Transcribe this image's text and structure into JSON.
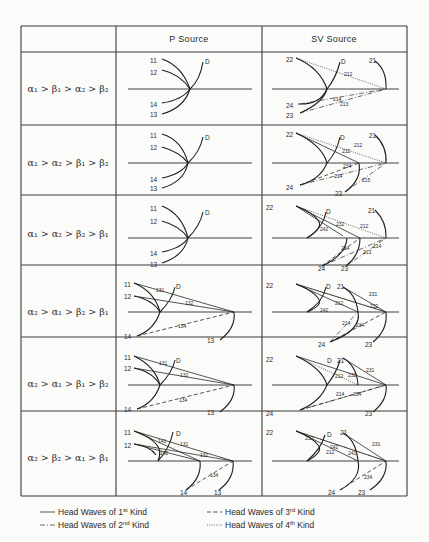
{
  "table": {
    "columns": [
      "",
      "P  Source",
      "SV  Source"
    ],
    "rows": [
      {
        "condition": "α₁ > β₁ > α₂ > β₂"
      },
      {
        "condition": "α₁ > α₂ > β₁ > β₂"
      },
      {
        "condition": "α₁ > α₂ > β₂ > β₁"
      },
      {
        "condition": "α₂ > α₁ > β₂ > β₁"
      },
      {
        "condition": "α₂ > α₁ > β₁ > β₂"
      },
      {
        "condition": "α₂ > β₂ > α₁ > β₁"
      }
    ]
  },
  "geometry": {
    "x": [
      21,
      116,
      262,
      407
    ],
    "y": [
      26,
      52,
      125,
      195,
      265,
      337,
      411,
      496
    ]
  },
  "diagrams": [
    {
      "row": 0,
      "p": {
        "iface": [
          [
            128,
            89
          ],
          [
            252,
            89
          ]
        ],
        "curves": [
          "M162,59 Q182,66 190,89",
          "M162,70 Q180,74 190,89",
          "M162,103 Q182,100 190,89",
          "M162,114 Q184,108 190,89",
          "M190,89 Q200,80 203,62"
        ],
        "lines": [],
        "labels": [
          [
            "11",
            150,
            61
          ],
          [
            "12",
            150,
            73
          ],
          [
            "14",
            150,
            105
          ],
          [
            "13",
            150,
            115
          ],
          [
            "D",
            205,
            62
          ]
        ]
      },
      "sv": {
        "iface": [
          [
            272,
            89
          ],
          [
            399,
            89
          ]
        ],
        "curves": [
          "M296,58 Q320,68 327,89 Q320,105 298,104",
          "M300,113 Q323,103 327,89 Q336,78 340,62",
          "M375,61 Q387,70 386,89"
        ],
        "lines": [
          [
            "k4",
            296,
            58,
            386,
            89
          ],
          [
            "k2",
            300,
            104,
            386,
            89
          ],
          [
            "k2",
            300,
            113,
            386,
            89
          ]
        ],
        "labels": [
          [
            "22",
            286,
            60
          ],
          [
            "D",
            341,
            62
          ],
          [
            "21",
            369,
            61
          ],
          [
            "24",
            286,
            106
          ],
          [
            "23",
            286,
            116
          ]
        ],
        "small": [
          [
            "212",
            344,
            76
          ],
          [
            "214",
            333,
            101
          ],
          [
            "213",
            340,
            106
          ]
        ]
      }
    },
    {
      "row": 1,
      "p": {
        "iface": [
          [
            128,
            163
          ],
          [
            252,
            163
          ]
        ],
        "curves": [
          "M162,134 Q182,140 188,163",
          "M162,147 Q180,152 188,163",
          "M162,178 Q182,174 188,163",
          "M162,188 Q184,182 188,163",
          "M188,163 Q200,152 203,137"
        ],
        "lines": [],
        "labels": [
          [
            "11",
            150,
            136
          ],
          [
            "12",
            150,
            148
          ],
          [
            "14",
            150,
            180
          ],
          [
            "13",
            150,
            189
          ],
          [
            "D",
            205,
            138
          ]
        ]
      },
      "sv": {
        "iface": [
          [
            272,
            163
          ],
          [
            399,
            163
          ]
        ],
        "curves": [
          "M296,133 Q322,145 327,163 Q320,180 300,185",
          "M327,163 Q337,152 340,137",
          "M375,135 Q387,146 386,163",
          "M359,163 Q362,180 345,192"
        ],
        "lines": [
          [
            "k4",
            296,
            133,
            386,
            163
          ],
          [
            "k1",
            296,
            133,
            359,
            163
          ],
          [
            "k3",
            300,
            185,
            359,
            163
          ],
          [
            "k2",
            300,
            185,
            386,
            163
          ],
          [
            "k2",
            345,
            192,
            386,
            163
          ]
        ],
        "labels": [
          [
            "22",
            286,
            135
          ],
          [
            "D",
            340,
            138
          ],
          [
            "21",
            369,
            136
          ],
          [
            "24",
            286,
            188
          ],
          [
            "23",
            335,
            194
          ]
        ],
        "small": [
          [
            "212",
            354,
            147
          ],
          [
            "232",
            342,
            153
          ],
          [
            "234",
            343,
            168
          ],
          [
            "214",
            334,
            178
          ],
          [
            "215",
            362,
            182
          ]
        ]
      }
    },
    {
      "row": 2,
      "p": {
        "iface": [
          [
            128,
            238
          ],
          [
            252,
            238
          ]
        ],
        "curves": [
          "M162,206 Q182,214 188,238",
          "M162,221 Q180,226 188,238",
          "M162,252 Q182,248 188,238",
          "M162,263 Q184,256 188,238",
          "M188,238 Q200,226 203,212"
        ],
        "lines": [],
        "labels": [
          [
            "11",
            150,
            209
          ],
          [
            "12",
            150,
            222
          ],
          [
            "14",
            150,
            254
          ],
          [
            "13",
            150,
            265
          ],
          [
            "D",
            205,
            213
          ]
        ]
      },
      "sv": {
        "iface": [
          [
            272,
            238
          ],
          [
            399,
            238
          ]
        ],
        "curves": [
          "M296,206 Q312,212 318,220 Q324,228 307,238",
          "M307,238 Q323,228 326,212",
          "M375,210 Q387,222 386,238",
          "M347,238 Q346,255 322,266",
          "M360,238 Q360,255 346,266"
        ],
        "lines": [
          [
            "k4",
            296,
            206,
            386,
            238
          ],
          [
            "k1",
            296,
            206,
            360,
            238
          ],
          [
            "k1",
            296,
            206,
            343,
            236
          ],
          [
            "k3",
            322,
            266,
            360,
            238
          ],
          [
            "k2",
            346,
            266,
            386,
            238
          ],
          [
            "k2",
            322,
            266,
            386,
            238
          ]
        ],
        "labels": [
          [
            "22",
            266,
            208
          ],
          [
            "D",
            326,
            212
          ],
          [
            "21",
            368,
            211
          ],
          [
            "24",
            318,
            269
          ],
          [
            "23",
            341,
            269
          ]
        ],
        "small": [
          [
            "232",
            336,
            226
          ],
          [
            "242",
            320,
            231
          ],
          [
            "212",
            360,
            228
          ],
          [
            "234",
            341,
            250
          ],
          [
            "214",
            373,
            248
          ],
          [
            "213",
            363,
            254
          ]
        ]
      }
    },
    {
      "row": 3,
      "p": {
        "iface": [
          [
            128,
            312
          ],
          [
            252,
            312
          ]
        ],
        "curves": [
          "M134,283 Q155,292 160,312 Q154,330 137,336",
          "M134,296 Q153,300 160,312",
          "M160,312 Q172,300 175,287",
          "M234,312 Q236,328 220,340"
        ],
        "lines": [
          [
            "k1",
            134,
            283,
            234,
            312
          ],
          [
            "k1",
            134,
            296,
            234,
            312
          ],
          [
            "k3",
            137,
            336,
            234,
            312
          ]
        ],
        "labels": [
          [
            "11",
            124,
            285
          ],
          [
            "12",
            124,
            297
          ],
          [
            "D",
            176,
            287
          ],
          [
            "14",
            124,
            337
          ],
          [
            "13",
            207,
            341
          ]
        ],
        "small": [
          [
            "131",
            156,
            292
          ],
          [
            "132",
            185,
            305
          ],
          [
            "134",
            178,
            328
          ]
        ]
      }
    },
    {
      "row": 4,
      "p": {
        "iface": [
          [
            128,
            385
          ],
          [
            252,
            385
          ]
        ],
        "curves": [
          "M134,356 Q155,366 160,385 Q154,403 137,409",
          "M134,368 Q153,372 160,385",
          "M160,385 Q172,373 175,360",
          "M234,385 Q236,400 220,412"
        ],
        "lines": [
          [
            "k1",
            134,
            356,
            234,
            385
          ],
          [
            "k1",
            134,
            368,
            234,
            385
          ],
          [
            "k3",
            137,
            409,
            234,
            385
          ]
        ],
        "labels": [
          [
            "11",
            124,
            358
          ],
          [
            "12",
            124,
            369
          ],
          [
            "D",
            176,
            361
          ],
          [
            "14",
            124,
            410
          ],
          [
            "13",
            207,
            413
          ]
        ],
        "small": [
          [
            "131",
            159,
            365
          ],
          [
            "132",
            180,
            377
          ],
          [
            "134",
            179,
            402
          ]
        ]
      }
    },
    {
      "row": 5,
      "p": {
        "iface": [
          [
            128,
            461
          ],
          [
            252,
            461
          ]
        ],
        "curves": [
          "M134,431 Q150,436 157,445 Q162,452 158,461",
          "M134,444 Q150,446 156,455",
          "M158,461 Q170,448 173,432",
          "M200,461 Q202,478 186,490",
          "M233,461 Q235,478 219,490"
        ],
        "lines": [
          [
            "k1",
            134,
            431,
            233,
            461
          ],
          [
            "k1",
            134,
            444,
            233,
            461
          ],
          [
            "k1",
            134,
            431,
            200,
            461
          ],
          [
            "k1",
            134,
            444,
            200,
            461
          ],
          [
            "k3",
            186,
            490,
            233,
            461
          ]
        ],
        "labels": [
          [
            "11",
            124,
            433
          ],
          [
            "12",
            124,
            446
          ],
          [
            "D",
            176,
            434
          ],
          [
            "14",
            180,
            493
          ],
          [
            "13",
            214,
            493
          ]
        ],
        "small": [
          [
            "141",
            158,
            443
          ],
          [
            "131",
            180,
            446
          ],
          [
            "142",
            160,
            455
          ],
          [
            "132",
            200,
            457
          ],
          [
            "134",
            210,
            477
          ]
        ]
      }
    }
  ],
  "sv_extra": [
    {
      "row": 3,
      "curves": [
        "M296,284 Q312,290 318,298 Q324,305 307,312",
        "M307,312 Q323,302 326,287",
        "M343,287 Q356,294 358,312",
        "M358,312 Q362,330 330,342",
        "M386,312 Q388,330 373,342"
      ],
      "lines": [
        [
          "k1",
          296,
          284,
          386,
          312
        ],
        [
          "k1",
          296,
          284,
          358,
          312
        ],
        [
          "k4",
          296,
          284,
          386,
          312
        ],
        [
          "k1",
          343,
          287,
          386,
          312
        ],
        [
          "k2",
          330,
          342,
          358,
          312
        ],
        [
          "k3",
          330,
          342,
          386,
          312
        ]
      ],
      "labels": [
        [
          "22",
          266,
          286
        ],
        [
          "D",
          326,
          287
        ],
        [
          "21",
          337,
          287
        ],
        [
          "24",
          318,
          345
        ],
        [
          "23",
          365,
          345
        ]
      ],
      "small": [
        [
          "231",
          369,
          296
        ],
        [
          "212",
          335,
          305
        ],
        [
          "242",
          320,
          312
        ],
        [
          "232",
          370,
          308
        ],
        [
          "214",
          342,
          325
        ],
        [
          "234",
          356,
          327
        ]
      ]
    },
    {
      "row": 4,
      "curves": [
        "M296,356 Q322,368 327,385 Q320,402 300,410",
        "M327,385 Q337,372 340,360",
        "M343,358 Q357,366 358,385",
        "M386,385 Q388,400 373,412"
      ],
      "lines": [
        [
          "k1",
          296,
          356,
          386,
          385
        ],
        [
          "k4",
          296,
          356,
          358,
          385
        ],
        [
          "k1",
          343,
          358,
          386,
          385
        ],
        [
          "k2",
          300,
          410,
          386,
          385
        ],
        [
          "k3",
          300,
          410,
          386,
          385
        ]
      ],
      "labels": [
        [
          "22",
          266,
          360
        ],
        [
          "D",
          327,
          361
        ],
        [
          "21",
          337,
          361
        ],
        [
          "24",
          266,
          414
        ],
        [
          "23",
          365,
          414
        ]
      ],
      "small": [
        [
          "231",
          366,
          372
        ],
        [
          "232",
          348,
          377
        ],
        [
          "212",
          335,
          378
        ],
        [
          "214",
          336,
          396
        ],
        [
          "234",
          353,
          396
        ]
      ]
    },
    {
      "row": 5,
      "curves": [
        "M296,431 Q312,437 318,445 Q324,452 307,461",
        "M307,461 Q321,449 325,435",
        "M343,433 Q356,440 358,461",
        "M358,461 Q362,478 340,490",
        "M386,461 Q388,478 370,490"
      ],
      "lines": [
        [
          "k1",
          296,
          431,
          386,
          461
        ],
        [
          "k1",
          296,
          431,
          358,
          461
        ],
        [
          "k4",
          296,
          431,
          386,
          461
        ],
        [
          "k1",
          343,
          433,
          386,
          461
        ],
        [
          "k3",
          340,
          490,
          386,
          461
        ]
      ],
      "labels": [
        [
          "22",
          266,
          433
        ],
        [
          "D",
          327,
          435
        ],
        [
          "21",
          340,
          433
        ],
        [
          "24",
          328,
          493
        ],
        [
          "23",
          358,
          493
        ]
      ],
      "small": [
        [
          "232",
          305,
          440
        ],
        [
          "242",
          330,
          449
        ],
        [
          "212",
          326,
          454
        ],
        [
          "241",
          348,
          455
        ],
        [
          "231",
          372,
          446
        ],
        [
          "234",
          364,
          479
        ]
      ]
    }
  ],
  "legend": {
    "items": [
      {
        "style": "k1",
        "label": "Head Waves of 1",
        "sup": "st",
        "suffix": " Kind",
        "x": 58,
        "y": 515
      },
      {
        "style": "k2",
        "label": "Head Waves of 2",
        "sup": "nd",
        "suffix": " Kind",
        "x": 58,
        "y": 528
      },
      {
        "style": "k3",
        "label": "Head Waves of 3",
        "sup": "rd",
        "suffix": " Kind",
        "x": 225,
        "y": 515
      },
      {
        "style": "k4",
        "label": "Head Waves of 4",
        "sup": "th",
        "suffix": " Kind",
        "x": 225,
        "y": 528
      }
    ]
  }
}
